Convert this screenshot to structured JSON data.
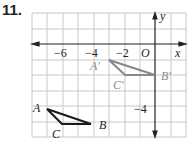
{
  "problem_number": "11.",
  "axes": {
    "x_label": "x",
    "y_label": "y",
    "origin_label": "O"
  },
  "tick_labels": {
    "x": [
      "−6",
      "−4",
      "−2"
    ],
    "y": [
      "−4"
    ]
  },
  "triangle_original": {
    "color": "#1a1a1a",
    "labels": [
      "A",
      "B",
      "C"
    ],
    "A": [
      -7,
      -4
    ],
    "B": [
      -4,
      -5
    ],
    "C": [
      -6,
      -5
    ]
  },
  "triangle_image": {
    "color": "#888888",
    "labels": [
      "A′",
      "B′",
      "C′"
    ],
    "A": [
      -3,
      -1
    ],
    "B": [
      0,
      -2
    ],
    "C": [
      -2,
      -2
    ]
  }
}
